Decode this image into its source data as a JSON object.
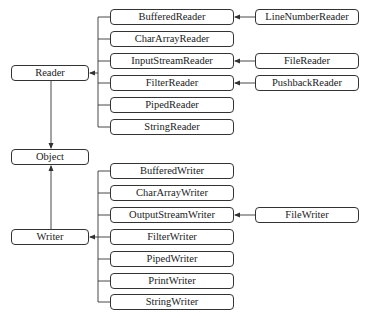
{
  "diagram": {
    "type": "class-hierarchy",
    "line_color": "#333333",
    "box_border_color": "#333333",
    "text_color": "#222222",
    "nodes": [
      {
        "id": "reader",
        "label": "Reader",
        "x": 11,
        "y": 65,
        "w": 78,
        "h": 16
      },
      {
        "id": "object",
        "label": "Object",
        "x": 11,
        "y": 149,
        "w": 78,
        "h": 16
      },
      {
        "id": "writer",
        "label": "Writer",
        "x": 11,
        "y": 229,
        "w": 78,
        "h": 16
      },
      {
        "id": "bufferedreader",
        "label": "BufferedReader",
        "x": 110,
        "y": 9,
        "w": 124,
        "h": 16
      },
      {
        "id": "chararrayreader",
        "label": "CharArrayReader",
        "x": 110,
        "y": 31,
        "w": 124,
        "h": 16
      },
      {
        "id": "inputstreamreader",
        "label": "InputStreamReader",
        "x": 110,
        "y": 53,
        "w": 124,
        "h": 16
      },
      {
        "id": "filterreader",
        "label": "FilterReader",
        "x": 110,
        "y": 75,
        "w": 124,
        "h": 16
      },
      {
        "id": "pipedreader",
        "label": "PipedReader",
        "x": 110,
        "y": 97,
        "w": 124,
        "h": 16
      },
      {
        "id": "stringreader",
        "label": "StringReader",
        "x": 110,
        "y": 119,
        "w": 124,
        "h": 16
      },
      {
        "id": "linenumberreader",
        "label": "LineNumberReader",
        "x": 255,
        "y": 9,
        "w": 104,
        "h": 16
      },
      {
        "id": "filereader",
        "label": "FileReader",
        "x": 255,
        "y": 53,
        "w": 104,
        "h": 16
      },
      {
        "id": "pushbackreader",
        "label": "PushbackReader",
        "x": 255,
        "y": 75,
        "w": 104,
        "h": 16
      },
      {
        "id": "bufferedwriter",
        "label": "BufferedWriter",
        "x": 110,
        "y": 163,
        "w": 124,
        "h": 16
      },
      {
        "id": "chararraywriter",
        "label": "CharArrayWriter",
        "x": 110,
        "y": 185,
        "w": 124,
        "h": 16
      },
      {
        "id": "outputstreamwriter",
        "label": "OutputStreamWriter",
        "x": 110,
        "y": 207,
        "w": 124,
        "h": 16
      },
      {
        "id": "filterwriter",
        "label": "FilterWriter",
        "x": 110,
        "y": 229,
        "w": 124,
        "h": 16
      },
      {
        "id": "pipedwriter",
        "label": "PipedWriter",
        "x": 110,
        "y": 251,
        "w": 124,
        "h": 16
      },
      {
        "id": "printwriter",
        "label": "PrintWriter",
        "x": 110,
        "y": 273,
        "w": 124,
        "h": 16
      },
      {
        "id": "stringwriter",
        "label": "StringWriter",
        "x": 110,
        "y": 294,
        "w": 124,
        "h": 16
      },
      {
        "id": "filewriter",
        "label": "FileWriter",
        "x": 255,
        "y": 207,
        "w": 104,
        "h": 16
      }
    ],
    "edges": [
      {
        "from": "reader",
        "to": "object"
      },
      {
        "from": "writer",
        "to": "object"
      },
      {
        "from": "bufferedreader",
        "to": "reader"
      },
      {
        "from": "chararrayreader",
        "to": "reader"
      },
      {
        "from": "inputstreamreader",
        "to": "reader"
      },
      {
        "from": "filterreader",
        "to": "reader"
      },
      {
        "from": "pipedreader",
        "to": "reader"
      },
      {
        "from": "stringreader",
        "to": "reader"
      },
      {
        "from": "linenumberreader",
        "to": "bufferedreader"
      },
      {
        "from": "filereader",
        "to": "inputstreamreader"
      },
      {
        "from": "pushbackreader",
        "to": "filterreader"
      },
      {
        "from": "bufferedwriter",
        "to": "writer"
      },
      {
        "from": "chararraywriter",
        "to": "writer"
      },
      {
        "from": "outputstreamwriter",
        "to": "writer"
      },
      {
        "from": "filterwriter",
        "to": "writer"
      },
      {
        "from": "pipedwriter",
        "to": "writer"
      },
      {
        "from": "printwriter",
        "to": "writer"
      },
      {
        "from": "stringwriter",
        "to": "writer"
      },
      {
        "from": "filewriter",
        "to": "outputstreamwriter"
      }
    ]
  }
}
